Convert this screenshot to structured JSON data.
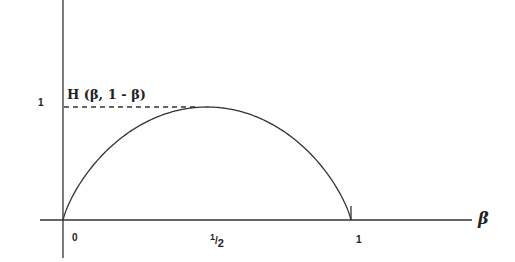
{
  "chart_data": {
    "type": "line",
    "xlabel": "β",
    "ylabel": "",
    "x_ticks": [
      "0",
      "1/2",
      "1"
    ],
    "y_ticks": [
      "1"
    ],
    "xlim": [
      0,
      1.3
    ],
    "ylim": [
      0,
      1.8
    ],
    "grid": false,
    "annotations": [
      "dashed line at y = 1 from the axis to the maximum"
    ],
    "series": [
      {
        "name": "H(β, 1 - β)",
        "x": [
          0,
          0.05,
          0.1,
          0.2,
          0.3,
          0.4,
          0.5,
          0.6,
          0.7,
          0.8,
          0.9,
          0.95,
          1
        ],
        "values": [
          0,
          0.286,
          0.469,
          0.722,
          0.881,
          0.971,
          1.0,
          0.971,
          0.881,
          0.722,
          0.469,
          0.286,
          0
        ]
      }
    ]
  },
  "labels": {
    "curve_label": "H (β, 1 - β)",
    "y_tick_1": "1",
    "x_tick_0": "0",
    "x_tick_half_num": "1",
    "x_tick_half_den": "2",
    "x_tick_1": "1",
    "x_axis_label": "β"
  }
}
